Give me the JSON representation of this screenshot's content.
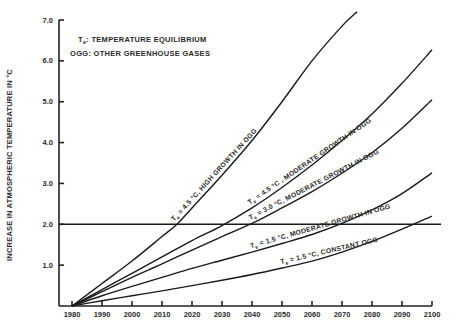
{
  "chart_data": {
    "type": "line",
    "title": "",
    "legend": {
      "line1_prefix": "T",
      "line1_sub": "e",
      "line1_rest": ": TEMPERATURE  EQUILIBRIUM",
      "line2": "OGG: OTHER GREENHOUSE GASES",
      "placement": "top-left"
    },
    "xlabel": "",
    "ylabel": "INCREASE IN ATMOSPHERIC TEMPERATURE IN °C",
    "xlim": [
      1980,
      2100
    ],
    "ylim": [
      0,
      7.0
    ],
    "xticks": [
      "1980",
      "1990",
      "2000",
      "2010",
      "2020",
      "2030",
      "2040",
      "2050",
      "2060",
      "2070",
      "2080",
      "2090",
      "2100"
    ],
    "yticks": [
      "1.0",
      "2.0",
      "3.0",
      "4.0",
      "5.0",
      "6.0",
      "7.0"
    ],
    "ytick_values": [
      1,
      2,
      3,
      4,
      5,
      6,
      7
    ],
    "reference_line": {
      "y": 2.0,
      "label": ""
    },
    "series": [
      {
        "name": "Te = 4.5 °C, HIGH GROWTH IN OGG",
        "label_te": "T",
        "label_sub": "e",
        "label_rest": " = 4.5 °C, HIGH GROWTH IN OGG",
        "x": [
          1980,
          1990,
          2000,
          2010,
          2015,
          2020,
          2030,
          2040,
          2050,
          2060,
          2070,
          2075
        ],
        "y": [
          0,
          0.55,
          1.1,
          1.7,
          2.0,
          2.4,
          3.2,
          4.05,
          5.0,
          6.0,
          6.85,
          7.2
        ]
      },
      {
        "name": "Te = 4.5 °C , MODERATE GROWTH IN OGG",
        "label_te": "T",
        "label_sub": "e",
        "label_rest": " = 4.5 °C , MODERATE GROWTH IN OGG",
        "x": [
          1980,
          1990,
          2000,
          2010,
          2020,
          2030,
          2040,
          2050,
          2060,
          2070,
          2080,
          2090,
          2100
        ],
        "y": [
          0,
          0.4,
          0.8,
          1.2,
          1.6,
          1.97,
          2.4,
          2.9,
          3.45,
          4.05,
          4.7,
          5.45,
          6.27
        ]
      },
      {
        "name": "Te = 3.0 °C, MODERATE GROWTH IN OGG",
        "label_te": "T",
        "label_sub": "e",
        "label_rest": " = 3.0 °C, MODERATE GROWTH IN OGG",
        "x": [
          1980,
          1990,
          2000,
          2010,
          2020,
          2030,
          2040,
          2050,
          2060,
          2070,
          2080,
          2090,
          2100
        ],
        "y": [
          0,
          0.35,
          0.7,
          1.03,
          1.37,
          1.7,
          2.02,
          2.4,
          2.8,
          3.25,
          3.75,
          4.35,
          5.05
        ]
      },
      {
        "name": "Te = 1.5 °C, MODERATE GROWTH IN OGG",
        "label_te": "T",
        "label_sub": "e",
        "label_rest": " = 1.5 °C, MODERATE GROWTH IN OGG",
        "x": [
          1980,
          1990,
          2000,
          2010,
          2020,
          2030,
          2040,
          2050,
          2060,
          2070,
          2080,
          2090,
          2100
        ],
        "y": [
          0,
          0.25,
          0.48,
          0.7,
          0.92,
          1.12,
          1.32,
          1.53,
          1.75,
          2.02,
          2.35,
          2.75,
          3.26
        ]
      },
      {
        "name": "Te = 1.5 °C, CONSTANT OGG",
        "label_te": "T",
        "label_sub": "e",
        "label_rest": " = 1.5 °C, CONSTANT OGG",
        "x": [
          1980,
          1990,
          2000,
          2010,
          2020,
          2030,
          2040,
          2050,
          2060,
          2070,
          2080,
          2090,
          2100
        ],
        "y": [
          0,
          0.13,
          0.25,
          0.37,
          0.5,
          0.63,
          0.77,
          0.93,
          1.1,
          1.32,
          1.58,
          1.88,
          2.2
        ]
      }
    ]
  }
}
